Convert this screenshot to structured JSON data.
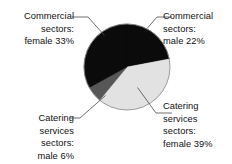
{
  "chart_data": {
    "type": "pie",
    "title": "",
    "subtitle": "",
    "xlabel": "",
    "ylabel": "",
    "legend_position": "callout-labels",
    "grid": false,
    "unit": "%",
    "total": 100,
    "categories": [
      "Commercial sectors: male",
      "Catering services sectors: female",
      "Catering services sectors: male",
      "Commercial sectors: female"
    ],
    "values": [
      22,
      39,
      6,
      33
    ],
    "colors": [
      "#0b0b0b",
      "#e2e2e2",
      "#575757",
      "#0b0b0b"
    ],
    "slices": [
      {
        "key": "commercial-male",
        "label_lines": [
          "Commercial",
          "sectors:",
          "male 22%"
        ],
        "category": "Commercial sectors: male",
        "value": 22,
        "color": "#0b0b0b",
        "start_angle_deg": 0,
        "end_angle_deg": 79.2
      },
      {
        "key": "catering-female",
        "label_lines": [
          "Catering",
          "services",
          "sectors:",
          "female 39%"
        ],
        "category": "Catering services sectors: female",
        "value": 39,
        "color": "#e2e2e2",
        "start_angle_deg": 79.2,
        "end_angle_deg": 219.6
      },
      {
        "key": "catering-male",
        "label_lines": [
          "Catering",
          "services",
          "sectors:",
          "male 6%"
        ],
        "category": "Catering services sectors: male",
        "value": 6,
        "color": "#575757",
        "start_angle_deg": 219.6,
        "end_angle_deg": 241.2
      },
      {
        "key": "commercial-female",
        "label_lines": [
          "Commercial",
          "sectors:",
          "female 33%"
        ],
        "category": "Commercial sectors: female",
        "value": 33,
        "color": "#0b0b0b",
        "start_angle_deg": 241.2,
        "end_angle_deg": 360
      }
    ]
  },
  "labels": {
    "commercial_female": {
      "line1": "Commercial",
      "line2": "sectors:",
      "line3": "female 33%"
    },
    "commercial_male": {
      "line1": "Commercial",
      "line2": "sectors:",
      "line3": "male 22%"
    },
    "catering_male": {
      "line1": "Catering",
      "line2": "services",
      "line3": "sectors:",
      "line4": "male 6%"
    },
    "catering_female": {
      "line1": "Catering",
      "line2": "services",
      "line3": "sectors:",
      "line4": "female 39%"
    }
  },
  "geometry": {
    "center_x": 127,
    "center_y": 67,
    "radius": 43
  }
}
